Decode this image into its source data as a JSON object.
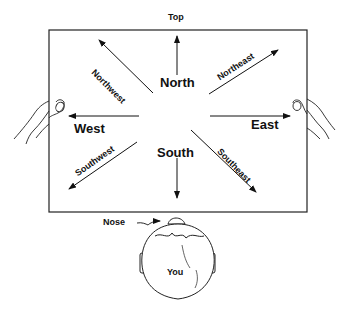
{
  "diagram": {
    "top_label": "Top",
    "directions": {
      "north": "North",
      "south": "South",
      "east": "East",
      "west": "West",
      "northeast": "Northeast",
      "northwest": "Northwest",
      "southeast": "Southeast",
      "southwest": "Southwest"
    },
    "nose_label": "Nose",
    "you_label": "You"
  }
}
